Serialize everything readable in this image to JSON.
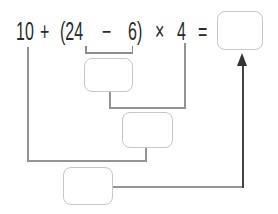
{
  "expression": {
    "full": "10 + (24 − 6) × 4 =",
    "tokens": {
      "t0": "10",
      "t1": "+",
      "t2": "(24",
      "t3": "−",
      "t4": "6)",
      "t5": "×",
      "t6": "4",
      "t7": "="
    }
  },
  "boxes": {
    "answer": {
      "value": ""
    },
    "step1": {
      "value": ""
    },
    "step2": {
      "value": ""
    },
    "step3": {
      "value": ""
    }
  },
  "diagram": {
    "step1_operation": "24 − 6",
    "step2_operation": "step1 × 4",
    "step3_operation": "10 + step2",
    "arrow_target": "answer"
  },
  "colors": {
    "text": "#2b2b2b",
    "connector_gray": "#949494",
    "bracket_gray": "#8d8d8d",
    "box_border": "#c7c7c7",
    "arrow_dark": "#333333",
    "background": "#ffffff"
  }
}
